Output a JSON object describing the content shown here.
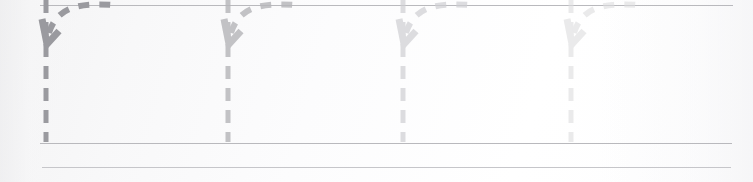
{
  "canvas": {
    "width": 753,
    "height": 182,
    "background_color": "#fbfbfc",
    "description": "Faint diagram overlay of four dashed loop-back arrows above horizontal rule lines"
  },
  "rules": [
    {
      "name": "top-rule",
      "x": 40,
      "y": 5,
      "width": 693,
      "color": "#b9b9bd"
    },
    {
      "name": "baseline-rule",
      "x": 40,
      "y": 143,
      "width": 692,
      "color": "#b9b9bd"
    },
    {
      "name": "secondary-rule",
      "x": 42,
      "y": 167,
      "width": 689,
      "color": "#c6c6ca"
    }
  ],
  "arrows": [
    {
      "id": "arrow-1",
      "label": "loop-back-arrow-1",
      "x": 46,
      "color": "#9a9a9f",
      "opacity": 1.0,
      "tail_top": 0,
      "tail_bottom": 142,
      "curve_end_x": 113,
      "dash": "5 8",
      "stroke_width": 5
    },
    {
      "id": "arrow-2",
      "label": "loop-back-arrow-2",
      "x": 228,
      "color": "#b6b6ba",
      "opacity": 0.82,
      "tail_top": 0,
      "tail_bottom": 142,
      "curve_end_x": 295,
      "dash": "5 8",
      "stroke_width": 5
    },
    {
      "id": "arrow-3",
      "label": "loop-back-arrow-3",
      "x": 403,
      "color": "#cfcfd3",
      "opacity": 0.7,
      "tail_top": 0,
      "tail_bottom": 142,
      "curve_end_x": 470,
      "dash": "5 8",
      "stroke_width": 5
    },
    {
      "id": "arrow-4",
      "label": "loop-back-arrow-4",
      "x": 571,
      "color": "#dededf",
      "opacity": 0.62,
      "tail_top": 0,
      "tail_bottom": 142,
      "curve_end_x": 638,
      "dash": "5 8",
      "stroke_width": 5
    }
  ],
  "colors": {
    "rule_strong": "#b9b9bd",
    "rule_soft": "#c6c6ca",
    "arrow_darkest": "#9a9a9f",
    "arrow_lightest": "#dededf",
    "background": "#fbfbfc"
  }
}
